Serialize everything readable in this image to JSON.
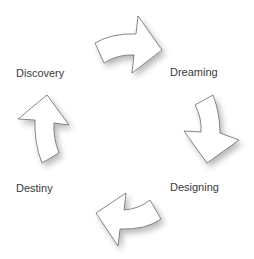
{
  "diagram": {
    "type": "cycle",
    "direction": "clockwise",
    "stages": [
      {
        "id": "discovery",
        "label": "Discovery"
      },
      {
        "id": "dreaming",
        "label": "Dreaming"
      },
      {
        "id": "designing",
        "label": "Designing"
      },
      {
        "id": "destiny",
        "label": "Destiny"
      }
    ],
    "arrows": [
      {
        "from": "discovery",
        "to": "dreaming",
        "icon": "curved-arrow-right-icon"
      },
      {
        "from": "dreaming",
        "to": "designing",
        "icon": "curved-arrow-down-icon"
      },
      {
        "from": "designing",
        "to": "destiny",
        "icon": "curved-arrow-left-icon"
      },
      {
        "from": "destiny",
        "to": "discovery",
        "icon": "curved-arrow-up-icon"
      }
    ]
  },
  "colors": {
    "background": "#ffffff",
    "arrow_fill": "#ffffff",
    "arrow_stroke": "#555555",
    "label_text": "#3a3a3a"
  }
}
